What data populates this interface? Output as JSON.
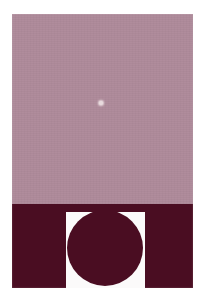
{
  "figure": {
    "kind": "scanned-photograph",
    "caption": "",
    "width": 205,
    "height": 306,
    "page_background": "#ffffff",
    "plate": {
      "x": 12,
      "y": 14,
      "width": 181,
      "height": 274
    }
  },
  "colors": {
    "page_white": "#ffffff",
    "notch_white": "#fbfafa",
    "background_mauve": "#b08c9c",
    "mid_mauve": "#a3808f",
    "bright_ring": "#c9b0b8",
    "brightest_ring": "#cdb7bd",
    "dark_maroon": "#4a0d22",
    "core_maroon": "#43101f",
    "deep_shadow": "#3d0c1c"
  },
  "upper_panel": {
    "name": "diffraction-pattern",
    "x": 12,
    "y": 14,
    "width": 181,
    "height": 190,
    "background": "#b08c9c",
    "center": {
      "x": 101,
      "y": 103
    },
    "central_disc_radius": 37,
    "center_dot": {
      "x": 101,
      "y": 103,
      "radius": 2,
      "color": "#e8dadd"
    },
    "ring_count": 7
  },
  "lower_panel": {
    "name": "dark-band-with-notch",
    "x": 12,
    "y": 204,
    "width": 181,
    "height": 84,
    "fill": "#4a0d22",
    "notch": {
      "x": 66,
      "y": 212,
      "width": 79,
      "height": 76,
      "fill": "#fbfafa"
    },
    "disc": {
      "cx": 105,
      "cy": 248,
      "radius": 38,
      "fill": "#4a0d22"
    }
  },
  "chart_data": {
    "type": "heatmap",
    "title": "",
    "xlabel": "",
    "ylabel": "",
    "series": [
      {
        "name": "radial-intensity-profile",
        "x": [
          0,
          2,
          8,
          16,
          24,
          32,
          37,
          41,
          46,
          52,
          58,
          63,
          69,
          75,
          81,
          87,
          93,
          99,
          105,
          112,
          120,
          128
        ],
        "values": [
          0.92,
          0.06,
          0.05,
          0.05,
          0.06,
          0.09,
          0.22,
          0.58,
          0.82,
          0.74,
          0.46,
          0.34,
          0.58,
          0.7,
          0.52,
          0.4,
          0.56,
          0.64,
          0.48,
          0.44,
          0.54,
          0.5
        ],
        "units": "normalized brightness"
      }
    ],
    "rings": [
      {
        "index": 0,
        "type": "dark-core",
        "inner_radius": 0,
        "outer_radius": 37,
        "brightness": 0.06,
        "color": "#43101f"
      },
      {
        "index": 1,
        "type": "bright-ring",
        "inner_radius": 37,
        "outer_radius": 52,
        "brightness": 0.82,
        "color": "#cdb7bd"
      },
      {
        "index": 2,
        "type": "dark-ring",
        "inner_radius": 52,
        "outer_radius": 63,
        "brightness": 0.34,
        "color": "#9c7887"
      },
      {
        "index": 3,
        "type": "bright-ring",
        "inner_radius": 63,
        "outer_radius": 76,
        "brightness": 0.7,
        "color": "#c2a3ad"
      },
      {
        "index": 4,
        "type": "dark-ring",
        "inner_radius": 76,
        "outer_radius": 88,
        "brightness": 0.4,
        "color": "#a3808f"
      },
      {
        "index": 5,
        "type": "bright-ring",
        "inner_radius": 88,
        "outer_radius": 100,
        "brightness": 0.62,
        "color": "#bb9aa6"
      },
      {
        "index": 6,
        "type": "dark-ring",
        "inner_radius": 100,
        "outer_radius": 112,
        "brightness": 0.46,
        "color": "#a98695"
      },
      {
        "index": 7,
        "type": "bright-ring",
        "inner_radius": 112,
        "outer_radius": 128,
        "brightness": 0.54,
        "color": "#b49 2a0"
      }
    ],
    "axis_ranges": {
      "radius_px": [
        0,
        128
      ],
      "brightness": [
        0,
        1
      ]
    },
    "grid": false,
    "legend_position": "none"
  }
}
